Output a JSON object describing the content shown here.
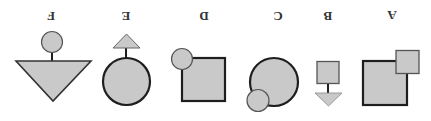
{
  "diagram": {
    "title": "",
    "orientation": "rotated-180",
    "colors": {
      "fill": "#c9c9c9",
      "stroke": "#1e1e1e",
      "thin_stroke": "#555555",
      "label": "#333333"
    },
    "figures": [
      {
        "label": "F",
        "description": "small circle on stem above downward triangle"
      },
      {
        "label": "E",
        "description": "small triangle on stem above large circle"
      },
      {
        "label": "D",
        "description": "small circle overlapping top-left corner of square"
      },
      {
        "label": "C",
        "description": "small circle overlapping bottom-left of large circle"
      },
      {
        "label": "B",
        "description": "small square with stem to downward triangle"
      },
      {
        "label": "A",
        "description": "small square overlapping top-right corner of large square"
      }
    ]
  }
}
